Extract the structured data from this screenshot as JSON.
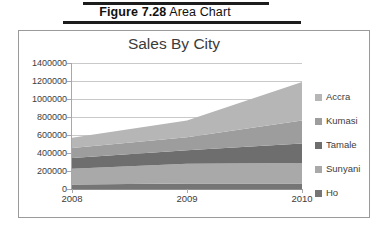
{
  "caption": {
    "figure_number": "Figure 7.28",
    "figure_title": " Area Chart"
  },
  "chart_data": {
    "type": "area",
    "stacked": true,
    "title": "Sales By City",
    "xlabel": "",
    "ylabel": "",
    "x": [
      "2008",
      "2009",
      "2010"
    ],
    "categories": [
      "2008",
      "2009",
      "2010"
    ],
    "ylim": [
      0,
      1400000
    ],
    "yticks": [
      0,
      200000,
      400000,
      600000,
      800000,
      1000000,
      1200000,
      1400000
    ],
    "ytick_labels": [
      "0",
      "200000",
      "400000",
      "600000",
      "800000",
      "1000000",
      "1200000",
      "1400000"
    ],
    "grid": true,
    "legend_position": "right",
    "series": [
      {
        "name": "Accra",
        "values": [
          115000,
          185000,
          430000
        ],
        "color": "#b6b6b6"
      },
      {
        "name": "Kumasi",
        "values": [
          110000,
          145000,
          255000
        ],
        "color": "#9d9d9d"
      },
      {
        "name": "Tamale",
        "values": [
          120000,
          150000,
          215000
        ],
        "color": "#6e6e6e"
      },
      {
        "name": "Sunyani",
        "values": [
          175000,
          220000,
          230000
        ],
        "color": "#a9a9a9"
      },
      {
        "name": "Ho",
        "values": [
          50000,
          60000,
          60000
        ],
        "color": "#757575"
      }
    ],
    "stack_order_bottom_to_top": [
      "Ho",
      "Sunyani",
      "Tamale",
      "Kumasi",
      "Accra"
    ],
    "totals": [
      570000,
      760000,
      1190000
    ]
  },
  "legend": {
    "items": [
      {
        "label": "Accra",
        "color": "#b6b6b6"
      },
      {
        "label": "Kumasi",
        "color": "#9d9d9d"
      },
      {
        "label": "Tamale",
        "color": "#6e6e6e"
      },
      {
        "label": "Sunyani",
        "color": "#a9a9a9"
      },
      {
        "label": "Ho",
        "color": "#757575"
      }
    ]
  }
}
